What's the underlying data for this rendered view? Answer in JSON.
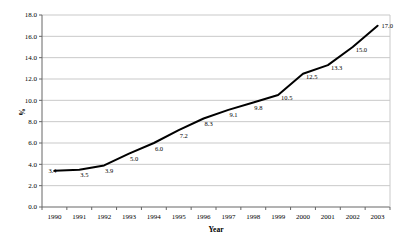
{
  "chart_data": {
    "type": "line",
    "title": "",
    "xlabel": "Year",
    "ylabel": "%",
    "categories": [
      "1990",
      "1991",
      "1992",
      "1993",
      "1994",
      "1995",
      "1996",
      "1997",
      "1998",
      "1999",
      "2000",
      "2001",
      "2002",
      "2003"
    ],
    "values": [
      3.4,
      3.5,
      3.9,
      5.0,
      6.0,
      7.2,
      8.3,
      9.1,
      9.8,
      10.5,
      12.5,
      13.3,
      15.0,
      17.0
    ],
    "data_labels": [
      "3.4",
      "3.5",
      "3.9",
      "5.0",
      "6.0",
      "7.2",
      "8.3",
      "9.1",
      "9.8",
      "10.5",
      "12.5",
      "13.3",
      "15.0",
      "17.0"
    ],
    "ylim": [
      0.0,
      18.0
    ],
    "ytick_step": 2.0,
    "ytick_labels": [
      "0.0",
      "2.0",
      "4.0",
      "6.0",
      "8.0",
      "10.0",
      "12.0",
      "14.0",
      "16.0",
      "18.0"
    ],
    "grid": true,
    "legend": "none",
    "colors": {
      "line": "#000000",
      "grid": "#c9c9c9",
      "axis": "#666666",
      "text": "#000000",
      "background": "#ffffff"
    }
  }
}
